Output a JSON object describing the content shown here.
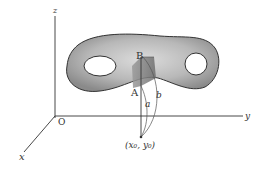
{
  "figure": {
    "type": "3d-surface-diagram",
    "axes": {
      "x_label": "x",
      "y_label": "y",
      "z_label": "z",
      "origin_label": "O"
    },
    "points": {
      "upper_label": "B",
      "lower_label": "A",
      "base_label": "(x₀, y₀)"
    },
    "arcs": {
      "inner_label": "a",
      "outer_label": "b"
    },
    "colors": {
      "line": "#333333",
      "surface_dark": "#7a7a7a",
      "surface_light": "#d8d8d8",
      "background": "#ffffff"
    }
  }
}
